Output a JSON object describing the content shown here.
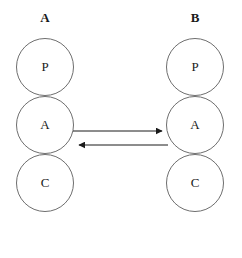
{
  "diagram": {
    "title": "",
    "background_color": "#ffffff",
    "stroke_color": "#6e6e6e",
    "edge_color": "#1a1a1a",
    "text_color": "#1a1a1a",
    "columns": [
      {
        "id": "A",
        "label": "A",
        "nodes": [
          {
            "id": "A-P",
            "label": "P"
          },
          {
            "id": "A-A",
            "label": "A"
          },
          {
            "id": "A-C",
            "label": "C"
          }
        ]
      },
      {
        "id": "B",
        "label": "B",
        "nodes": [
          {
            "id": "B-P",
            "label": "P"
          },
          {
            "id": "B-A",
            "label": "A"
          },
          {
            "id": "B-C",
            "label": "C"
          }
        ]
      }
    ],
    "edges": [
      {
        "id": "edge-a-to-b",
        "from": "A-A",
        "to": "B-A",
        "direction": "right",
        "arrowhead": "filled-triangle"
      },
      {
        "id": "edge-b-to-a",
        "from": "B-A",
        "to": "A-A",
        "direction": "left",
        "arrowhead": "filled-triangle"
      }
    ]
  }
}
